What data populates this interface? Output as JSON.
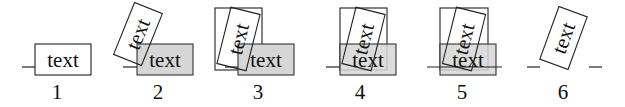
{
  "diagram": {
    "box_text": "text",
    "colors": {
      "outline": "#222222",
      "gray_fill": "#d6d6d6",
      "background": "#ffffff"
    },
    "panels": [
      {
        "number": "1",
        "horizontal_text": "text",
        "horizontal_box_fill": "white"
      },
      {
        "number": "2",
        "rotated_text": "text",
        "horizontal_text": "text",
        "horizontal_box_fill": "gray"
      },
      {
        "number": "3",
        "rotated_text": "text",
        "horizontal_text": "text",
        "horizontal_box_fill": "gray",
        "bounding_box": true
      },
      {
        "number": "4",
        "rotated_text": "text",
        "horizontal_text": "text",
        "horizontal_box_fill": "gray",
        "bounding_box": true
      },
      {
        "number": "5",
        "rotated_text": "text",
        "horizontal_text": "text",
        "horizontal_box_fill": "gray",
        "bounding_box": true
      },
      {
        "number": "6",
        "rotated_text": "text"
      }
    ]
  }
}
